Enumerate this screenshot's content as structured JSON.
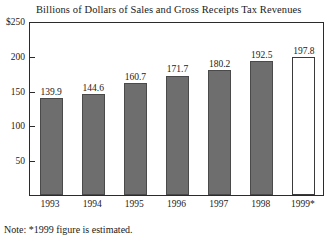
{
  "chart_data": {
    "type": "bar",
    "title": "Billions of Dollars of Sales and Gross Receipts Tax Revenues",
    "xlabel": "",
    "ylabel": "",
    "categories": [
      "1993",
      "1994",
      "1995",
      "1996",
      "1997",
      "1998",
      "1999*"
    ],
    "values": [
      139.9,
      144.6,
      160.7,
      171.7,
      180.2,
      192.5,
      197.8
    ],
    "value_labels": [
      "139.9",
      "144.6",
      "160.7",
      "171.7",
      "180.2",
      "192.5",
      "197.8"
    ],
    "ylim": [
      0,
      250
    ],
    "yticks": [
      250,
      200,
      150,
      100,
      50
    ],
    "ytick_labels": [
      "$250",
      "200",
      "150",
      "100",
      "50"
    ],
    "grid": false,
    "legend": null,
    "bar_styles": [
      "filled",
      "filled",
      "filled",
      "filled",
      "filled",
      "filled",
      "hollow"
    ],
    "colors": {
      "bar_fill": "#6e6e6e",
      "bar_edge": "#4a4a4a",
      "hollow_fill": "#ffffff",
      "hollow_edge": "#3a3a3a",
      "frame": "#2b2b2b",
      "text": "#1a1a1a",
      "background": "#ffffff"
    },
    "annotations": [
      "Note: *1999 figure is estimated."
    ]
  },
  "note": "Note: *1999 figure is estimated."
}
